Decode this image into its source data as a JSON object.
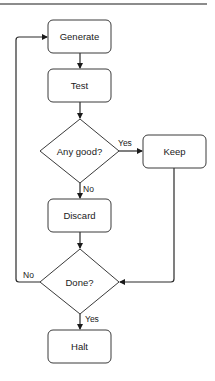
{
  "diagram": {
    "type": "flowchart",
    "nodes": [
      {
        "id": "generate",
        "shape": "rounded-rect",
        "label": "Generate"
      },
      {
        "id": "test",
        "shape": "rounded-rect",
        "label": "Test"
      },
      {
        "id": "any_good",
        "shape": "diamond",
        "label": "Any good?"
      },
      {
        "id": "keep",
        "shape": "rounded-rect",
        "label": "Keep"
      },
      {
        "id": "discard",
        "shape": "rounded-rect",
        "label": "Discard"
      },
      {
        "id": "done",
        "shape": "diamond",
        "label": "Done?"
      },
      {
        "id": "halt",
        "shape": "rounded-rect",
        "label": "Halt"
      }
    ],
    "edges": [
      {
        "from": "generate",
        "to": "test",
        "label": ""
      },
      {
        "from": "test",
        "to": "any_good",
        "label": ""
      },
      {
        "from": "any_good",
        "to": "keep",
        "label": "Yes"
      },
      {
        "from": "any_good",
        "to": "discard",
        "label": "No"
      },
      {
        "from": "discard",
        "to": "done",
        "label": ""
      },
      {
        "from": "keep",
        "to": "done",
        "label": ""
      },
      {
        "from": "done",
        "to": "generate",
        "label": "No"
      },
      {
        "from": "done",
        "to": "halt",
        "label": "Yes"
      }
    ]
  },
  "labels": {
    "generate": "Generate",
    "test": "Test",
    "any_good": "Any good?",
    "keep": "Keep",
    "discard": "Discard",
    "done": "Done?",
    "halt": "Halt",
    "any_good_yes": "Yes",
    "any_good_no": "No",
    "done_no": "No",
    "done_yes": "Yes"
  }
}
